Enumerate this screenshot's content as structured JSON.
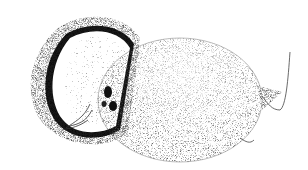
{
  "image": {
    "subject": "coconut illustration",
    "style": "stippled black-and-white engraving",
    "background_color": "#ffffff",
    "ink_color": "#1a1a1a",
    "elements": [
      {
        "name": "coconut-half-shell",
        "description": "halved coconut shell with fibrous husk and white flesh"
      },
      {
        "name": "whole-coconut",
        "description": "whole husked coconut with fibers and germination eyes"
      }
    ]
  }
}
